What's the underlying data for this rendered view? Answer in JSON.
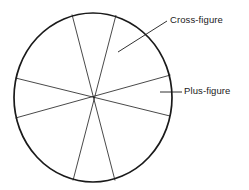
{
  "figure": {
    "type": "geometric-diagram",
    "background_color": "#ffffff",
    "stroke_color": "#1a1a1a",
    "circle": {
      "name": "main-circle",
      "center_x": 93,
      "center_y": 97.5,
      "radius_x": 79,
      "radius_y": 84.5,
      "stroke_width": 1.6
    },
    "chords": [
      {
        "name": "chord-vertical-left",
        "x1": 72,
        "y1": 15,
        "x2": 115,
        "y2": 180,
        "stroke_width": 0.8
      },
      {
        "name": "chord-vertical-right",
        "x1": 116,
        "y1": 15,
        "x2": 73,
        "y2": 180,
        "stroke_width": 0.8
      },
      {
        "name": "chord-horizontal-upper",
        "x1": 16,
        "y1": 78,
        "x2": 170,
        "y2": 116,
        "stroke_width": 0.8
      },
      {
        "name": "chord-horizontal-lower",
        "x1": 16,
        "y1": 118,
        "x2": 170,
        "y2": 75,
        "stroke_width": 0.8
      }
    ],
    "leaders": [
      {
        "name": "leader-cross-figure",
        "x1": 118,
        "y1": 52,
        "x2": 167,
        "y2": 21,
        "stroke_width": 0.9
      },
      {
        "name": "leader-plus-figure",
        "x1": 160,
        "y1": 92,
        "x2": 182,
        "y2": 92,
        "stroke_width": 0.9
      }
    ],
    "labels": {
      "cross_figure": "Cross-figure",
      "plus_figure": "Plus-figure"
    }
  }
}
